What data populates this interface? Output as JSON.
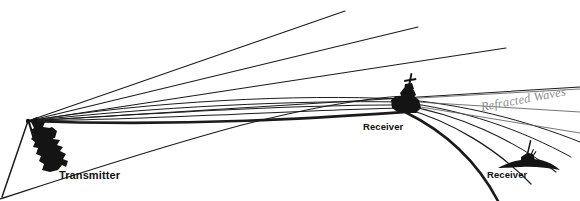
{
  "figure": {
    "background_color": "#ffffff",
    "width": 580,
    "height": 201,
    "ink_color": "#111111",
    "annotation_color": "#8d8d8d"
  },
  "labels": {
    "transmitter": "Transmitter",
    "receiver_mid": "Receiver",
    "receiver_right": "Receiver",
    "refracted_waves": "Refracted Waves"
  },
  "vessels": [
    {
      "name": "transmitter-ship",
      "label": "Transmitter",
      "type": "surface-ship",
      "x": 40,
      "y": 150
    },
    {
      "name": "receiver-ship-mid",
      "label": "Receiver",
      "type": "surface-ship",
      "x": 405,
      "y": 98
    },
    {
      "name": "receiver-submarine-right",
      "label": "Receiver",
      "type": "submarine",
      "x": 527,
      "y": 159
    }
  ],
  "paths": {
    "origin": {
      "x": 28,
      "y": 121
    },
    "straight_rays": [
      {
        "name": "ray-1",
        "d": "M28,121 L345,11"
      },
      {
        "name": "ray-2",
        "d": "M28,121 L418,27"
      },
      {
        "name": "ray-3",
        "d": "M28,121 L506,48"
      },
      {
        "name": "ray-4",
        "d": "M28,121 L580,87"
      }
    ],
    "refracted_rays": [
      {
        "name": "refracted-ray-1",
        "d": "M28,121 C150,100 300,95 400,100 C470,104 530,120 580,143"
      },
      {
        "name": "refracted-ray-2",
        "d": "M28,121 C150,106 300,101 401,103 C470,108 528,128 572,155"
      },
      {
        "name": "refracted-ray-3",
        "d": "M28,121 C160,112 310,105 403,106 C468,113 520,136 556,168"
      },
      {
        "name": "refracted-ray-4",
        "d": "M28,121 C170,118 320,110 404,109 C462,120 505,146 533,180"
      },
      {
        "name": "refracted-ray-thick",
        "d": "M28,121 C190,126 330,118 406,113 C455,131 487,160 505,201"
      }
    ],
    "downward_ray": {
      "name": "downward-ray",
      "d": "M28,121 L3,198"
    },
    "seafloor_curve": {
      "name": "lower-boundary-curve",
      "d": "M0,198 C60,178 150,148 240,124 C320,104 370,98 404,96"
    },
    "mid_fan": [
      {
        "name": "mid-fan-1",
        "d": "M400,99 L580,88"
      },
      {
        "name": "mid-fan-2",
        "d": "M400,101 L580,110"
      },
      {
        "name": "mid-fan-3",
        "d": "M402,104 L580,131"
      }
    ]
  }
}
